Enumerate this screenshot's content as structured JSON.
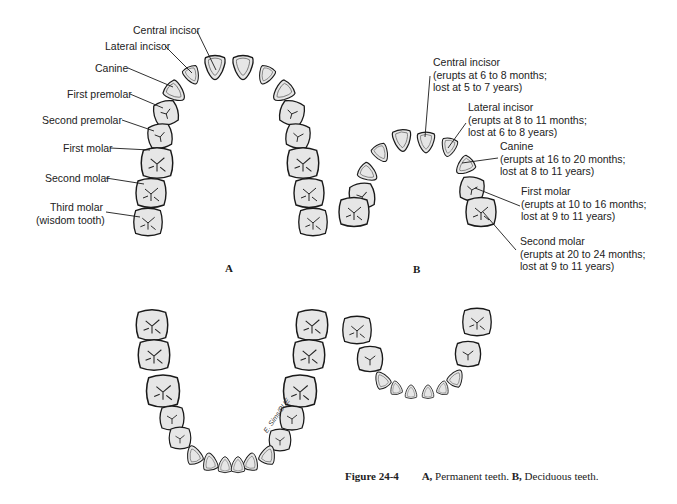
{
  "figure": {
    "number": "Figure 24-4",
    "caption_a_letter": "A,",
    "caption_a_text": " Permanent teeth. ",
    "caption_b_letter": "B,",
    "caption_b_text": " Deciduous teeth.",
    "signature": "E. Sims/BUE"
  },
  "panels": {
    "a": {
      "label": "A"
    },
    "b": {
      "label": "B"
    }
  },
  "permanent_labels": [
    {
      "name": "Central incisor"
    },
    {
      "name": "Lateral incisor"
    },
    {
      "name": "Canine"
    },
    {
      "name": "First premolar"
    },
    {
      "name": "Second premolar"
    },
    {
      "name": "First molar"
    },
    {
      "name": "Second molar"
    },
    {
      "name": "Third molar",
      "note": "(wisdom tooth)"
    }
  ],
  "deciduous_labels": [
    {
      "name": "Central incisor",
      "erupts": "(erupts at 6 to 8 months;",
      "lost": "lost at 5 to 7 years)"
    },
    {
      "name": "Lateral incisor",
      "erupts": "(erupts at 8 to 11 months;",
      "lost": "lost at 6 to 8 years)"
    },
    {
      "name": "Canine",
      "erupts": "(erupts at 16 to 20 months;",
      "lost": "lost at 8 to 11 years)"
    },
    {
      "name": "First molar",
      "erupts": "(erupts at 10 to 16 months;",
      "lost": "lost at 9 to 11 years)"
    },
    {
      "name": "Second molar",
      "erupts": "(erupts at 20 to 24 months;",
      "lost": "lost at 9 to 11 years)"
    }
  ],
  "colors": {
    "tooth_fill": "#e6e6e6",
    "outline": "#1a1a1a",
    "background": "#ffffff"
  }
}
